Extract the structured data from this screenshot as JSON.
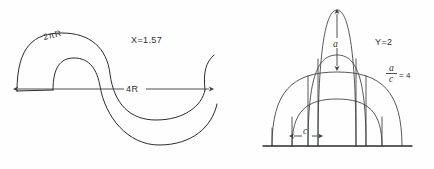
{
  "figure": {
    "title": "",
    "background_color": "#fefefe",
    "ink_color": "#2b2b2b",
    "width": 434,
    "height": 169
  },
  "left_diagram": {
    "name": "sinusoidal-band-diagram",
    "description": "S-shaped / sinusoidal band drawn as two parallel curves with a horizontal dimension arrow beneath",
    "labels": {
      "arc_length": "2πR",
      "x_value": "X=1.57",
      "span": "4R"
    },
    "dimension_arrow": {
      "label": "4R",
      "double_headed": true,
      "orientation": "horizontal"
    }
  },
  "right_diagram": {
    "name": "nested-arches-diagram",
    "description": "Four nested arch curves springing from a common horizontal baseline, with vertical springing lines",
    "labels": {
      "height": "a",
      "width": "c",
      "y_value": "Y=2",
      "ratio_numerator": "a",
      "ratio_denominator": "c",
      "ratio_value": "= 4"
    },
    "height_arrow": {
      "label": "a",
      "double_headed": true,
      "orientation": "vertical"
    },
    "width_arrow": {
      "label": "c",
      "double_headed": true,
      "orientation": "horizontal"
    },
    "arch_count": 4
  }
}
